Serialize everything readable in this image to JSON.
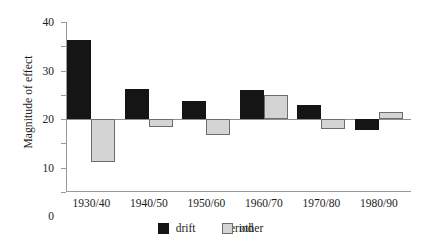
{
  "chart_data": {
    "type": "bar",
    "title": "",
    "xlabel": "Period",
    "ylabel": "Magnitude of effect",
    "categories": [
      "1930/40",
      "1940/50",
      "1950/60",
      "1960/70",
      "1970/80",
      "1980/90"
    ],
    "series": [
      {
        "name": "drift",
        "color": "#151515",
        "values": [
          32.5,
          12.3,
          7.5,
          11.8,
          6.0,
          -4.3
        ]
      },
      {
        "name": "other",
        "color": "#d4d4d4",
        "values": [
          -17.5,
          -3.3,
          -6.6,
          10.0,
          -4.0,
          2.8
        ]
      }
    ],
    "ylim": [
      -30,
      40
    ],
    "yticks": [
      40,
      30,
      20,
      10,
      0,
      -10,
      -20,
      -30
    ],
    "ytick_labels": [
      "40",
      "30",
      "20",
      "10",
      "0",
      "−10",
      "−20",
      "−30"
    ],
    "grid": false,
    "legend_position": "bottom",
    "legend_entries": [
      "drift",
      "other"
    ]
  }
}
